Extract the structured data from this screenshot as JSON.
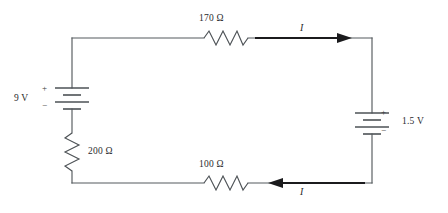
{
  "figure": {
    "type": "circuit-diagram",
    "title": "",
    "background_color": "#ffffff",
    "wire_color": "#555a5e",
    "arrow_color": "#1b1b1d"
  },
  "components": {
    "resistor_top": {
      "name": "resistor-170-ohm",
      "label": "170 Ω",
      "value": 170,
      "unit": "Ω",
      "orientation": "horizontal",
      "branch": "top"
    },
    "resistor_bottom": {
      "name": "resistor-100-ohm",
      "label": "100 Ω",
      "value": 100,
      "unit": "Ω",
      "orientation": "horizontal",
      "branch": "bottom"
    },
    "resistor_left": {
      "name": "resistor-200-ohm",
      "label": "200 Ω",
      "value": 200,
      "unit": "Ω",
      "orientation": "vertical",
      "branch": "left"
    },
    "battery_left": {
      "name": "battery-9-volt",
      "label": "9 V",
      "value": 9,
      "unit": "V",
      "orientation": "vertical",
      "plus_sign": "+",
      "minus_sign": "−",
      "plus_position": "top",
      "minus_position": "bottom"
    },
    "battery_right": {
      "name": "battery-1point5-volt",
      "label": "1.5 V",
      "value": 1.5,
      "unit": "V",
      "orientation": "vertical",
      "plus_sign": "+",
      "minus_sign": "−",
      "plus_position": "top",
      "minus_position": "bottom"
    }
  },
  "current_arrows": {
    "top": {
      "name": "current-arrow-top",
      "label": "I",
      "direction": "right",
      "label_position": "above"
    },
    "bottom": {
      "name": "current-arrow-bottom",
      "label": "I",
      "direction": "left",
      "label_position": "below"
    }
  }
}
